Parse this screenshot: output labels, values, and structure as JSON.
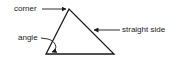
{
  "diagram": {
    "labels": {
      "corner": "corner",
      "angle": "angle",
      "straight_side": "straight side"
    },
    "colors": {
      "stroke": "#1a1a1a",
      "background": "#ffffff"
    },
    "shape": "triangle"
  }
}
